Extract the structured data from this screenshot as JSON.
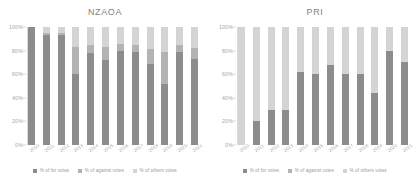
{
  "figure": {
    "background": "#ffffff",
    "panels": [
      "nzaoa",
      "pri"
    ]
  },
  "colors": {
    "for": "#8c8c8c",
    "against": "#b3b3b3",
    "others": "#d4d4d4",
    "axis": "#d9d9d9",
    "text": "#a6a6a6",
    "title": "#7f7f7f"
  },
  "yaxis": {
    "ticks": [
      "100%",
      "80%",
      "60%",
      "40%",
      "20%",
      "0%"
    ],
    "values": [
      100,
      80,
      60,
      40,
      20,
      0
    ]
  },
  "legend": {
    "items": [
      {
        "label": "% of for votes",
        "color": "#8c8c8c"
      },
      {
        "label": "% of against votes",
        "color": "#b3b3b3"
      },
      {
        "label": "% of others votes",
        "color": "#d4d4d4"
      }
    ]
  },
  "chart_data": [
    {
      "type": "bar",
      "stacked": true,
      "title": "NZAOA",
      "xlabel": "",
      "ylabel": "",
      "ylim": [
        0,
        100
      ],
      "grid": false,
      "legend_position": "bottom",
      "categories": [
        "2010",
        "2011",
        "2012",
        "2013",
        "2014",
        "2015",
        "2016",
        "2017",
        "2018",
        "2019",
        "2020",
        "2021"
      ],
      "series": [
        {
          "name": "% of for votes",
          "color": "#8c8c8c",
          "values": [
            100,
            93,
            93,
            60,
            78,
            72,
            80,
            79,
            69,
            52,
            79,
            73
          ]
        },
        {
          "name": "% of against votes",
          "color": "#b3b3b3",
          "values": [
            0,
            2,
            2,
            23,
            7,
            11,
            6,
            6,
            12,
            27,
            6,
            9
          ]
        },
        {
          "name": "% of others votes",
          "color": "#d4d4d4",
          "values": [
            0,
            5,
            5,
            17,
            15,
            17,
            14,
            15,
            19,
            21,
            15,
            18
          ]
        }
      ]
    },
    {
      "type": "bar",
      "stacked": true,
      "title": "PRI",
      "xlabel": "",
      "ylabel": "",
      "ylim": [
        0,
        100
      ],
      "grid": false,
      "legend_position": "bottom",
      "categories": [
        "2010",
        "2011",
        "2012",
        "2013",
        "2014",
        "2015",
        "2016",
        "2017",
        "2018",
        "2019",
        "2020",
        "2021"
      ],
      "series": [
        {
          "name": "% of for votes",
          "color": "#8c8c8c",
          "values": [
            0,
            20,
            30,
            30,
            62,
            60,
            68,
            60,
            60,
            44,
            80,
            70
          ]
        },
        {
          "name": "% of against votes",
          "color": "#b3b3b3",
          "values": [
            0,
            0,
            0,
            0,
            0,
            0,
            0,
            0,
            0,
            0,
            0,
            0
          ]
        },
        {
          "name": "% of others votes",
          "color": "#d4d4d4",
          "values": [
            100,
            80,
            70,
            70,
            38,
            40,
            32,
            40,
            40,
            56,
            20,
            30
          ]
        }
      ]
    }
  ]
}
